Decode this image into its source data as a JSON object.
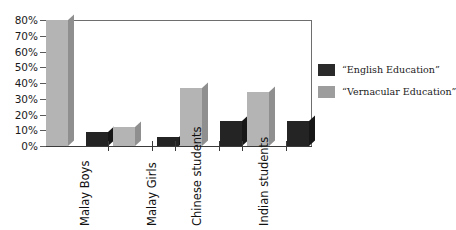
{
  "chart_data": {
    "type": "bar",
    "title": "",
    "subtitle": "",
    "xlabel": "",
    "ylabel": "",
    "categories": [
      "Malay Boys",
      "Malay Girls",
      "Chinese students",
      "Indian students"
    ],
    "series": [
      {
        "name": "“English Education”",
        "values": [
          9,
          6,
          16,
          16
        ],
        "color": "#2a2a2a"
      },
      {
        "name": "“Vernacular Education”",
        "values": [
          80,
          12,
          37,
          34
        ],
        "color": "#9d9d9d"
      }
    ],
    "ylim": [
      0,
      80
    ],
    "ytick_values": [
      0,
      10,
      20,
      30,
      40,
      50,
      60,
      70,
      80
    ],
    "ytick_labels": [
      "0%",
      "10%",
      "20%",
      "30%",
      "40%",
      "50%",
      "60%",
      "70%",
      "80%"
    ],
    "grid": false,
    "legend_position": "right",
    "style": "3d-bars"
  },
  "legend": {
    "items": [
      {
        "label": "“English Education”",
        "swatch": "dark-swatch"
      },
      {
        "label": "“Vernacular Education”",
        "swatch": "light-swatch"
      }
    ]
  },
  "axis": {
    "y": {
      "labels": [
        "80%",
        "70%",
        "60%",
        "50%",
        "40%",
        "30%",
        "20%",
        "10%",
        "0%"
      ]
    },
    "x": {
      "labels": [
        "Malay Boys",
        "Malay Girls",
        "Chinese students",
        "Indian students"
      ]
    }
  }
}
